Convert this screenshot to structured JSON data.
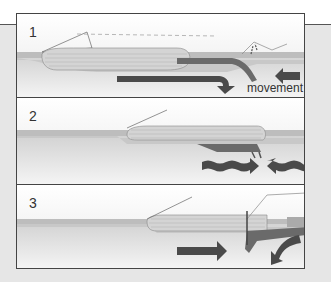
{
  "diagram": {
    "panels": [
      {
        "number": "1",
        "label": "movement",
        "arrows": [
          "long-right-bent-down-arrow",
          "short-left-arrow"
        ],
        "features": [
          "ice-sheet",
          "layered-block",
          "volcano",
          "subducting-plate"
        ]
      },
      {
        "number": "2",
        "arrows": [
          "wavy-right-arrow",
          "wavy-left-arrow"
        ],
        "features": [
          "ice-sheet",
          "layered-block",
          "collision-point"
        ]
      },
      {
        "number": "3",
        "arrows": [
          "right-arrow",
          "curved-down-left-arrow"
        ],
        "features": [
          "ice-sheet",
          "layered-block",
          "volcano",
          "mountain-uplift",
          "subducting-plate"
        ]
      }
    ],
    "colors": {
      "background": "#e6e6e6",
      "panel": "#ffffff",
      "border": "#444444",
      "arrow": "#4a4a4a",
      "block": "#cfcfcf",
      "ground": "#d9d9d9",
      "plate": "#777777"
    }
  }
}
